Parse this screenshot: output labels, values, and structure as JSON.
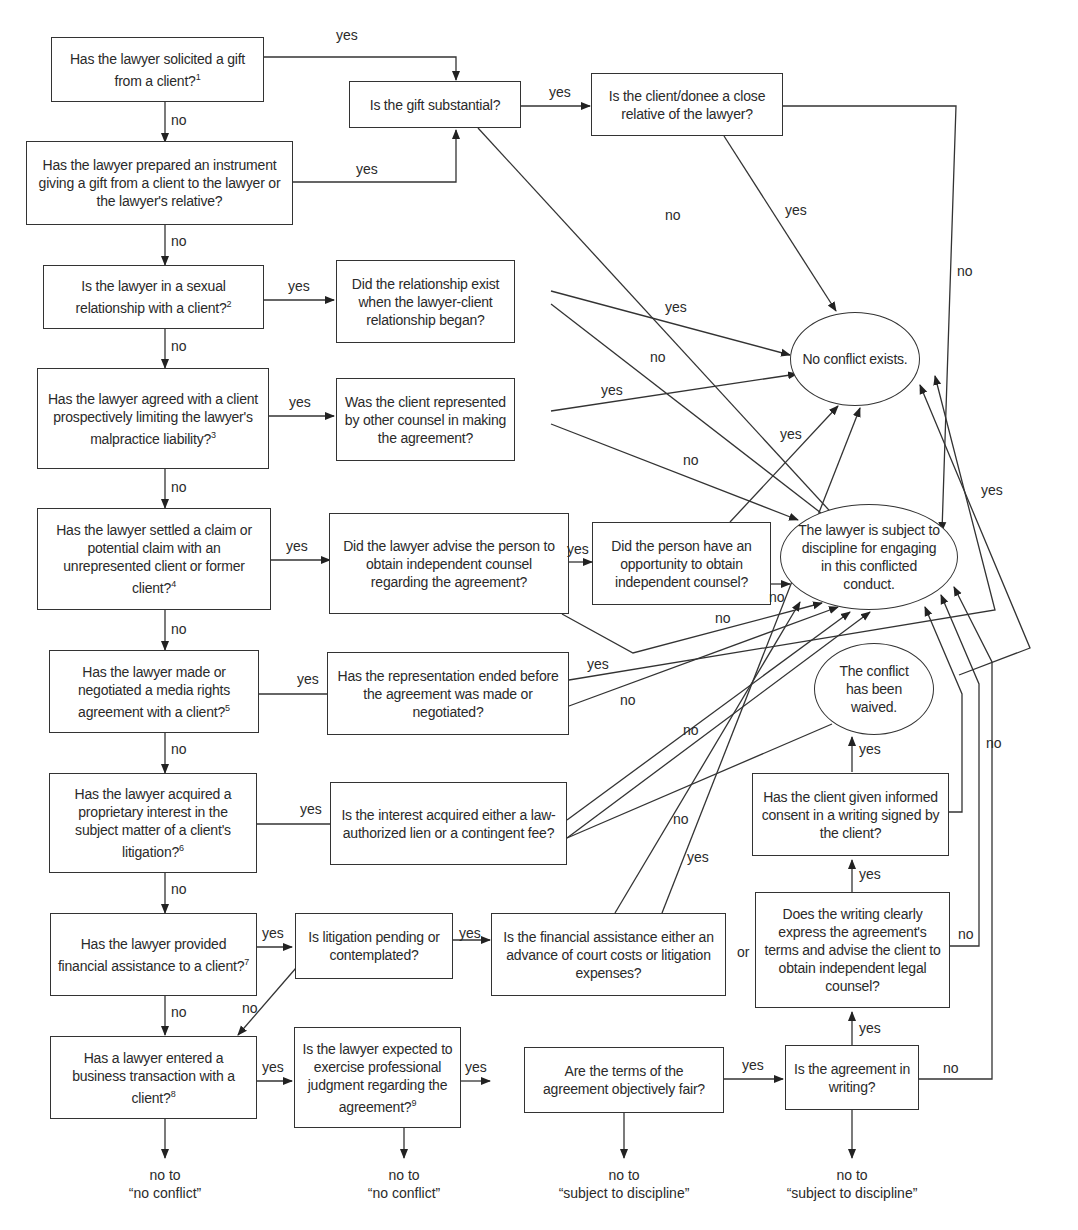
{
  "diagram": {
    "type": "flowchart",
    "topic": "Lawyer-client conflict of interest decision tree"
  },
  "nodes": {
    "q1": {
      "text": "Has the lawyer solicited a gift from a client?",
      "footnote": "1"
    },
    "q1_gift_substantial": {
      "text": "Is the gift substantial?"
    },
    "q1_close_relative": {
      "text": "Is the client/donee a close relative of the lawyer?"
    },
    "q2": {
      "text": "Has the lawyer prepared an instrument giving a gift from a client to the lawyer or the lawyer's relative?"
    },
    "q3": {
      "text": "Is the lawyer in a sexual relationship with a client?",
      "footnote": "2"
    },
    "q3_exist": {
      "text": "Did the relationship exist when the lawyer-client relationship began?"
    },
    "q4": {
      "text": "Has the lawyer agreed with a client prospectively limiting the lawyer's malpractice liability?",
      "footnote": "3"
    },
    "q4_represented": {
      "text": "Was the client represented by other counsel in making the agreement?"
    },
    "q5": {
      "text": "Has the lawyer settled a claim or potential claim with an unrepresented client or former client?",
      "footnote": "4"
    },
    "q5_advise": {
      "text": "Did the lawyer advise the person to obtain independent counsel regarding the agreement?"
    },
    "q5_opportunity": {
      "text": "Did the person have an opportunity to obtain independent counsel?"
    },
    "q6": {
      "text": "Has the lawyer made or negotiated a media rights agreement with a client?",
      "footnote": "5"
    },
    "q6_ended": {
      "text": "Has the representation ended before the agreement was made or negotiated?"
    },
    "q7": {
      "text": "Has the lawyer acquired a proprietary interest in the subject matter of a client's litigation?",
      "footnote": "6"
    },
    "q7_lien": {
      "text": "Is the interest acquired either a law-authorized lien or a contingent fee?"
    },
    "q8": {
      "text": "Has the lawyer provided financial assistance to a client?",
      "footnote": "7"
    },
    "q8_pending": {
      "text": "Is litigation pending or contemplated?"
    },
    "q8_advance": {
      "text": "Is the financial assistance either an advance of court costs or litigation expenses?"
    },
    "q9": {
      "text": "Has a lawyer entered a business transaction with a client?",
      "footnote": "8"
    },
    "q9_judgment": {
      "text": "Is the lawyer expected to exercise professional judgment regarding the agreement?",
      "footnote": "9"
    },
    "q9_fair": {
      "text": "Are the terms of the agreement objectively fair?"
    },
    "q9_writing": {
      "text": "Is the agreement in writing?"
    },
    "q9_clear": {
      "text": "Does the writing clearly express the agreement's terms and advise the client to obtain independent legal counsel?"
    },
    "q9_consent": {
      "text": "Has the client given informed consent in a writing signed by the client?"
    },
    "outcome_no_conflict": {
      "text": "No conflict exists."
    },
    "outcome_discipline": {
      "text": "The lawyer is subject to discipline for engaging in this conflicted conduct."
    },
    "outcome_waived": {
      "text": "The conflict has been waived."
    }
  },
  "terminals": {
    "t1": {
      "line1": "no to",
      "line2": "“no conflict”"
    },
    "t2": {
      "line1": "no to",
      "line2": "“no conflict”"
    },
    "t3": {
      "line1": "no to",
      "line2": "“subject to discipline”"
    },
    "t4": {
      "line1": "no to",
      "line2": "“subject to discipline”"
    }
  },
  "labels": {
    "yes": "yes",
    "no": "no",
    "or": "or"
  }
}
